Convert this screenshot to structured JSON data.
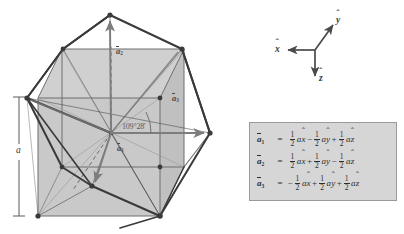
{
  "figure": {
    "lattice_parameter_label": "a",
    "angle_label": "109°28'",
    "angle_value_degrees": 109,
    "angle_value_minutes": 28
  },
  "axes": {
    "x_label": "x",
    "y_label": "y",
    "z_label": "z",
    "x_direction": "left",
    "y_direction": "up-right",
    "z_direction": "down"
  },
  "vectors": [
    {
      "id": "a1",
      "label": "a",
      "subscript": "1",
      "direction": "down-left-front"
    },
    {
      "id": "a2",
      "label": "a",
      "subscript": "2",
      "direction": "up"
    },
    {
      "id": "a3",
      "label": "a",
      "subscript": "3",
      "direction": "right"
    }
  ],
  "equations": [
    {
      "lhs": "a",
      "lhs_sub": "1",
      "eq": "=",
      "terms": [
        {
          "sign": "",
          "num": "1",
          "den": "2",
          "unit": "a",
          "axis": "x"
        },
        {
          "sign": "−",
          "num": "1",
          "den": "2",
          "unit": "a",
          "axis": "y"
        },
        {
          "sign": "+",
          "num": "1",
          "den": "2",
          "unit": "a",
          "axis": "z"
        }
      ]
    },
    {
      "lhs": "a",
      "lhs_sub": "2",
      "eq": "=",
      "terms": [
        {
          "sign": "",
          "num": "1",
          "den": "2",
          "unit": "a",
          "axis": "x"
        },
        {
          "sign": "+",
          "num": "1",
          "den": "2",
          "unit": "a",
          "axis": "y"
        },
        {
          "sign": "−",
          "num": "1",
          "den": "2",
          "unit": "a",
          "axis": "z"
        }
      ]
    },
    {
      "lhs": "a",
      "lhs_sub": "3",
      "eq": "=",
      "terms": [
        {
          "sign": "−",
          "num": "1",
          "den": "2",
          "unit": "a",
          "axis": "x"
        },
        {
          "sign": "+",
          "num": "1",
          "den": "2",
          "unit": "a",
          "axis": "y"
        },
        {
          "sign": "+",
          "num": "1",
          "den": "2",
          "unit": "a",
          "axis": "z"
        }
      ]
    }
  ],
  "colors": {
    "panel_background": "#d6d6d6",
    "panel_border": "#9a9a9a",
    "cube_face": "#c3c3c3",
    "cube_edge": "#6e6e6e",
    "polyhedron_edge": "#3a3a3a",
    "vector_arrow": "#7d7d7d",
    "text": "#2e2e2e",
    "page_background": "#ffffff"
  }
}
